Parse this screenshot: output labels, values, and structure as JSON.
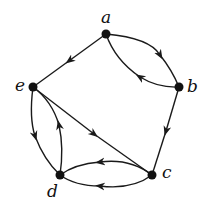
{
  "diagram": {
    "type": "directed-graph",
    "nodes": [
      {
        "id": "a",
        "label": "a",
        "x": 106,
        "y": 34,
        "label_x": 101,
        "label_y": 9
      },
      {
        "id": "b",
        "label": "b",
        "x": 179,
        "y": 87,
        "label_x": 187,
        "label_y": 78
      },
      {
        "id": "c",
        "label": "c",
        "x": 152,
        "y": 175,
        "label_x": 162,
        "label_y": 164
      },
      {
        "id": "d",
        "label": "d",
        "x": 60,
        "y": 175,
        "label_x": 47,
        "label_y": 183
      },
      {
        "id": "e",
        "label": "e",
        "x": 33,
        "y": 87,
        "label_x": 15,
        "label_y": 77
      }
    ],
    "edges": [
      {
        "from": "a",
        "to": "e",
        "shape": "straight"
      },
      {
        "from": "a",
        "to": "b",
        "shape": "curve-upper"
      },
      {
        "from": "b",
        "to": "a",
        "shape": "curve-lower"
      },
      {
        "from": "b",
        "to": "c",
        "shape": "straight"
      },
      {
        "from": "e",
        "to": "c",
        "shape": "straight"
      },
      {
        "from": "e",
        "to": "d",
        "shape": "curve-outer"
      },
      {
        "from": "d",
        "to": "e",
        "shape": "curve-inner"
      },
      {
        "from": "c",
        "to": "d",
        "shape": "curve-upper"
      },
      {
        "from": "c",
        "to": "d",
        "shape": "curve-lower"
      }
    ],
    "colors": {
      "stroke": "#1a1a1a",
      "node": "#111111",
      "background": "#ffffff"
    }
  }
}
